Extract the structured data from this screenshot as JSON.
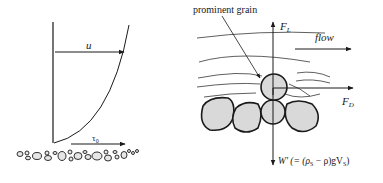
{
  "figure": {
    "left_panel": {
      "velocity_label": "u",
      "shear_label": "τ",
      "shear_subscript": "0"
    },
    "right_panel": {
      "grain_label": "prominent grain",
      "flow_label": "flow",
      "lift_label": "F",
      "lift_subscript": "L",
      "drag_label": "F",
      "drag_subscript": "D",
      "weight_label": "W' (= (ρ",
      "weight_sub1": "S",
      "weight_mid": " − ρ)gV",
      "weight_sub2": "S",
      "weight_end": ")"
    },
    "colors": {
      "stroke": "#1a1a1a",
      "grain_fill": "#d9d9d9"
    }
  }
}
